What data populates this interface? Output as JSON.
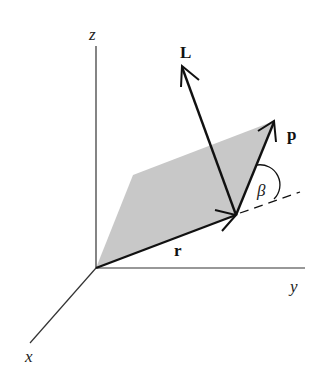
{
  "diagram": {
    "type": "3d-vector-diagram",
    "colors": {
      "line": "#111111",
      "axis": "#333333",
      "plane_fill": "#c8c8c8",
      "background": "#ffffff"
    },
    "axes": {
      "x": {
        "label": "x"
      },
      "y": {
        "label": "y"
      },
      "z": {
        "label": "z"
      }
    },
    "vectors": {
      "r": {
        "label": "r"
      },
      "p": {
        "label": "p"
      },
      "L": {
        "label": "L"
      }
    },
    "angle": {
      "label": "β",
      "between": [
        "r-extension",
        "p"
      ]
    }
  }
}
